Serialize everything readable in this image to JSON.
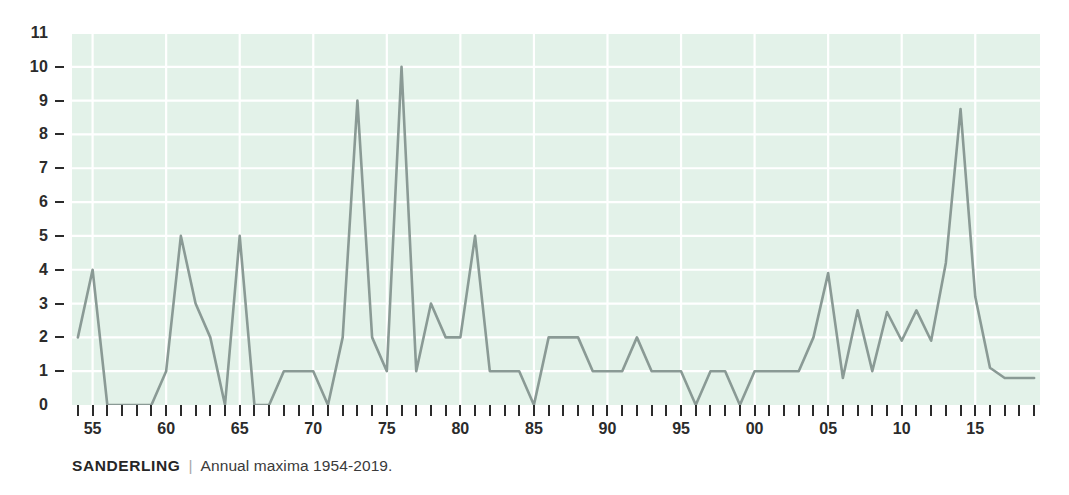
{
  "caption": {
    "species": "SANDERLING",
    "separator": "|",
    "description": "Annual maxima 1954-2019."
  },
  "colors": {
    "plot_background": "#e3f2e9",
    "gridline": "#ffffff",
    "series_line": "#8a9a95",
    "axis_text": "#2b2b2b",
    "page_background": "#ffffff"
  },
  "chart_data": {
    "type": "line",
    "title": "",
    "subtitle": "",
    "xlabel": "",
    "ylabel": "",
    "xlim": [
      1953.6,
      2019.4
    ],
    "ylim": [
      0,
      11
    ],
    "grid": true,
    "legend": false,
    "y_ticks": [
      0,
      1,
      2,
      3,
      4,
      5,
      6,
      7,
      8,
      9,
      10,
      11
    ],
    "y_tick_labels": [
      "0",
      "1",
      "2",
      "3",
      "4",
      "5",
      "6",
      "7",
      "8",
      "9",
      "10",
      "11"
    ],
    "x_tick_years": [
      1954,
      1955,
      1956,
      1957,
      1958,
      1959,
      1960,
      1961,
      1962,
      1963,
      1964,
      1965,
      1966,
      1967,
      1968,
      1969,
      1970,
      1971,
      1972,
      1973,
      1974,
      1975,
      1976,
      1977,
      1978,
      1979,
      1980,
      1981,
      1982,
      1983,
      1984,
      1985,
      1986,
      1987,
      1988,
      1989,
      1990,
      1991,
      1992,
      1993,
      1994,
      1995,
      1996,
      1997,
      1998,
      1999,
      2000,
      2001,
      2002,
      2003,
      2004,
      2005,
      2006,
      2007,
      2008,
      2009,
      2010,
      2011,
      2012,
      2013,
      2014,
      2015,
      2016,
      2017,
      2018,
      2019
    ],
    "x_labeled_ticks": [
      {
        "year": 1955,
        "label": "55"
      },
      {
        "year": 1960,
        "label": "60"
      },
      {
        "year": 1965,
        "label": "65"
      },
      {
        "year": 1970,
        "label": "70"
      },
      {
        "year": 1975,
        "label": "75"
      },
      {
        "year": 1980,
        "label": "80"
      },
      {
        "year": 1985,
        "label": "85"
      },
      {
        "year": 1990,
        "label": "90"
      },
      {
        "year": 1995,
        "label": "95"
      },
      {
        "year": 2000,
        "label": "00"
      },
      {
        "year": 2005,
        "label": "05"
      },
      {
        "year": 2010,
        "label": "10"
      },
      {
        "year": 2015,
        "label": "15"
      }
    ],
    "x": [
      1954,
      1955,
      1956,
      1957,
      1958,
      1959,
      1960,
      1961,
      1962,
      1963,
      1964,
      1965,
      1966,
      1967,
      1968,
      1969,
      1970,
      1971,
      1972,
      1973,
      1974,
      1975,
      1976,
      1977,
      1978,
      1979,
      1980,
      1981,
      1982,
      1983,
      1984,
      1985,
      1986,
      1987,
      1988,
      1989,
      1990,
      1991,
      1992,
      1993,
      1994,
      1995,
      1996,
      1997,
      1998,
      1999,
      2000,
      2001,
      2002,
      2003,
      2004,
      2005,
      2006,
      2007,
      2008,
      2009,
      2010,
      2011,
      2012,
      2013,
      2014,
      2015,
      2016,
      2017,
      2018,
      2019
    ],
    "values": [
      2,
      4,
      0,
      0,
      0,
      0,
      1,
      5,
      3,
      2,
      0,
      5,
      0,
      0,
      1,
      1,
      1,
      0,
      2,
      9,
      2,
      1,
      10,
      1,
      3,
      2,
      2,
      5,
      1,
      1,
      1,
      0,
      2,
      2,
      2,
      1,
      1,
      1,
      2,
      1,
      1,
      1,
      0,
      1,
      1,
      0,
      1,
      1,
      1,
      1,
      2,
      3.9,
      0.8,
      2.8,
      1,
      2.75,
      1.9,
      2.8,
      1.9,
      4.2,
      8.75,
      3.2,
      1.1,
      0.8,
      0.8,
      0.8
    ],
    "series_name": "Sanderling annual maxima"
  }
}
